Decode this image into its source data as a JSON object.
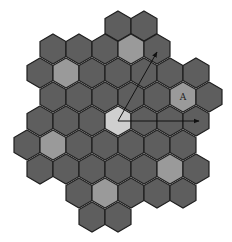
{
  "diagram": {
    "type": "hexagonal-lattice",
    "hex_size": 15,
    "colors": {
      "background": "#ffffff",
      "hex_dark": "#5e5e5e",
      "hex_medium": "#9a9a9a",
      "hex_light": "#cfcfcf",
      "hex_stroke": "#1e1e1e",
      "arrow": "#111111"
    },
    "rows": [
      {
        "y": 26,
        "xs": [
          118,
          144
        ]
      },
      {
        "y": 49,
        "xs": [
          53,
          79,
          105,
          131,
          157
        ]
      },
      {
        "y": 73,
        "xs": [
          40,
          66,
          92,
          118,
          144,
          170,
          196
        ]
      },
      {
        "y": 97,
        "xs": [
          53,
          79,
          105,
          131,
          157,
          183,
          209
        ]
      },
      {
        "y": 121,
        "xs": [
          40,
          66,
          92,
          118,
          144,
          170,
          196
        ]
      },
      {
        "y": 145,
        "xs": [
          27,
          53,
          79,
          105,
          131,
          157,
          183
        ]
      },
      {
        "y": 169,
        "xs": [
          40,
          66,
          92,
          118,
          144,
          170,
          196
        ]
      },
      {
        "y": 193,
        "xs": [
          79,
          105,
          131,
          157,
          183
        ]
      },
      {
        "y": 217,
        "xs": [
          92,
          118
        ]
      }
    ],
    "highlighted": [
      {
        "x": 131,
        "y": 49,
        "shade": "medium"
      },
      {
        "x": 66,
        "y": 73,
        "shade": "medium"
      },
      {
        "x": 183,
        "y": 97,
        "shade": "medium",
        "label": "A"
      },
      {
        "x": 118,
        "y": 121,
        "shade": "light"
      },
      {
        "x": 53,
        "y": 145,
        "shade": "medium"
      },
      {
        "x": 170,
        "y": 169,
        "shade": "medium"
      },
      {
        "x": 105,
        "y": 193,
        "shade": "medium"
      }
    ],
    "arrows": [
      {
        "name": "lattice-vector-1",
        "from": [
          118,
          121
        ],
        "to": [
          199,
          121
        ]
      },
      {
        "name": "lattice-vector-2",
        "from": [
          118,
          121
        ],
        "to": [
          157,
          52
        ]
      }
    ],
    "labels": {
      "a_label": "A"
    }
  }
}
